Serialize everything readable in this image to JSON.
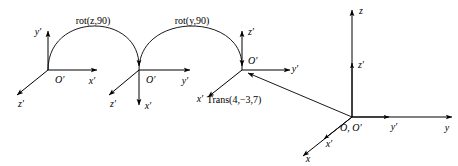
{
  "diagram": {
    "background_color": "#ffffff",
    "stroke_color": "#000000",
    "operations": [
      {
        "id": "rot-z-90",
        "label": "rot(z,90)"
      },
      {
        "id": "rot-y-90",
        "label": "rot(y,90)"
      },
      {
        "id": "trans-4-m3-7",
        "label": "Trans(4,−3,7)"
      }
    ],
    "frames": [
      {
        "id": "frame-1",
        "origin_label": "O′",
        "axes": [
          {
            "name": "y-prime",
            "label": "y′",
            "direction": "up"
          },
          {
            "name": "x-prime",
            "label": "x′",
            "direction": "right"
          },
          {
            "name": "z-prime",
            "label": "z′",
            "direction": "down-left"
          }
        ]
      },
      {
        "id": "frame-2",
        "origin_label": "O′",
        "axes": [
          {
            "name": "y-prime",
            "label": "y′",
            "direction": "right"
          },
          {
            "name": "z-prime",
            "label": "z′",
            "direction": "down-left"
          },
          {
            "name": "x-prime",
            "label": "x′",
            "direction": "down"
          }
        ]
      },
      {
        "id": "frame-3",
        "origin_label": "O′",
        "axes": [
          {
            "name": "z-prime",
            "label": "z′",
            "direction": "up"
          },
          {
            "name": "y-prime",
            "label": "y′",
            "direction": "right"
          },
          {
            "name": "x-prime",
            "label": "x′",
            "direction": "down-left"
          }
        ]
      },
      {
        "id": "frame-4",
        "origin_label": "O, O′",
        "axes": [
          {
            "name": "z",
            "label": "z",
            "direction": "up"
          },
          {
            "name": "z-prime",
            "label": "z′",
            "direction": "up"
          },
          {
            "name": "y",
            "label": "y",
            "direction": "right"
          },
          {
            "name": "y-prime",
            "label": "y′",
            "direction": "right"
          },
          {
            "name": "x",
            "label": "x",
            "direction": "down-left"
          },
          {
            "name": "x-prime",
            "label": "x′",
            "direction": "down-left"
          }
        ]
      }
    ]
  },
  "labels": {
    "rot_z_90": "rot(z,90)",
    "rot_y_90": "rot(y,90)",
    "trans": "Trans(4,−3,7)",
    "f1_origin": "O′",
    "f1_y": "y′",
    "f1_x": "x′",
    "f1_z": "z′",
    "f2_origin": "O′",
    "f2_y": "y′",
    "f2_x": "x′",
    "f2_z": "z′",
    "f3_origin": "O′",
    "f3_y": "y′",
    "f3_x": "x′",
    "f3_z": "z′",
    "f4_origin": "O, O′",
    "f4_z": "z",
    "f4_zp": "z′",
    "f4_y": "y",
    "f4_yp": "y′",
    "f4_x": "x",
    "f4_xp": "x′"
  }
}
